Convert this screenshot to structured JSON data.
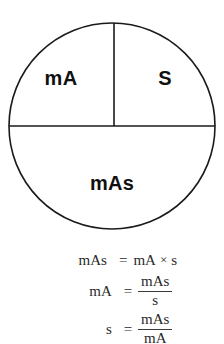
{
  "diagram": {
    "type": "circle-quadrant-mnemonic",
    "shape": "circle divided by a horizontal diameter and an upper vertical radius",
    "sections": {
      "top_left_label": "mA",
      "top_right_label": "S",
      "bottom_label": "mAs"
    },
    "colors": {
      "stroke": "#1a1a1a",
      "background": "#ffffff",
      "label_text": "#101010"
    }
  },
  "formulas": {
    "line1": {
      "lhs": "mAs",
      "equals": "=",
      "rhs_left": "mA",
      "operator": "×",
      "rhs_right": "s"
    },
    "line2": {
      "lhs": "mA",
      "equals": "=",
      "numerator": "mAs",
      "denominator": "s"
    },
    "line3": {
      "lhs": "s",
      "equals": "=",
      "numerator": "mAs",
      "denominator": "mA"
    }
  }
}
